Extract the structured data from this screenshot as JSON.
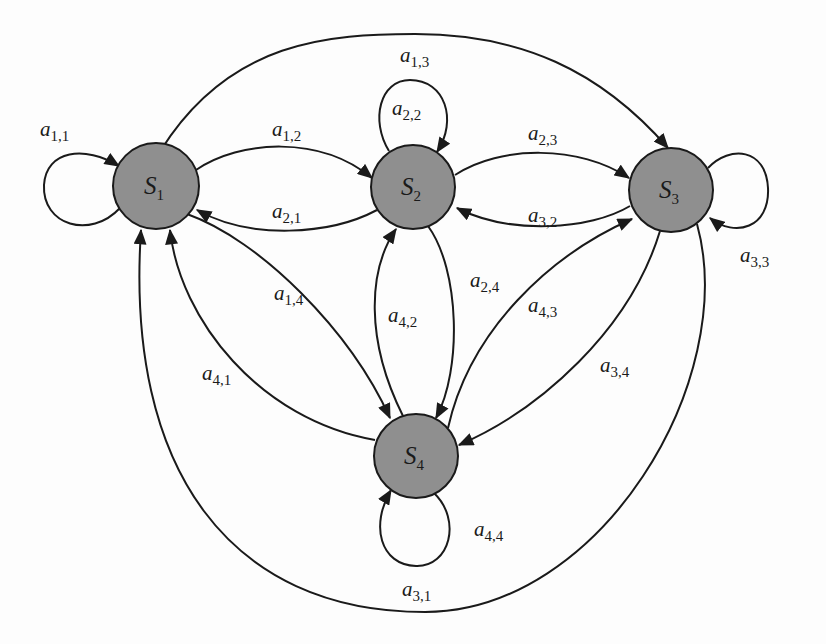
{
  "diagram": {
    "type": "markov-state-transition-graph",
    "colors": {
      "node_fill": "#8f8f8f",
      "stroke": "#1a1a1a",
      "background": "#fdfdfd"
    },
    "nodes": [
      {
        "id": "S1",
        "base": "S",
        "sub": "1",
        "cx": 156,
        "cy": 186,
        "r": 43
      },
      {
        "id": "S2",
        "base": "S",
        "sub": "2",
        "cx": 413,
        "cy": 187,
        "r": 42
      },
      {
        "id": "S3",
        "base": "S",
        "sub": "3",
        "cx": 671,
        "cy": 190,
        "r": 42
      },
      {
        "id": "S4",
        "base": "S",
        "sub": "4",
        "cx": 416,
        "cy": 456,
        "r": 42
      }
    ],
    "edges": [
      {
        "id": "a11",
        "from": "S1",
        "to": "S1",
        "label_base": "a",
        "label_sub": "1,1",
        "label_x": 40,
        "label_y": 136
      },
      {
        "id": "a12",
        "from": "S1",
        "to": "S2",
        "label_base": "a",
        "label_sub": "1,2",
        "label_x": 272,
        "label_y": 136
      },
      {
        "id": "a13",
        "from": "S1",
        "to": "S3",
        "label_base": "a",
        "label_sub": "1,3",
        "label_x": 400,
        "label_y": 62
      },
      {
        "id": "a21",
        "from": "S2",
        "to": "S1",
        "label_base": "a",
        "label_sub": "2,1",
        "label_x": 272,
        "label_y": 218
      },
      {
        "id": "a22",
        "from": "S2",
        "to": "S2",
        "label_base": "a",
        "label_sub": "2,2",
        "label_x": 392,
        "label_y": 115
      },
      {
        "id": "a23",
        "from": "S2",
        "to": "S3",
        "label_base": "a",
        "label_sub": "2,3",
        "label_x": 528,
        "label_y": 140
      },
      {
        "id": "a32",
        "from": "S3",
        "to": "S2",
        "label_base": "a",
        "label_sub": "3,2",
        "label_x": 528,
        "label_y": 222
      },
      {
        "id": "a33",
        "from": "S3",
        "to": "S3",
        "label_base": "a",
        "label_sub": "3,3",
        "label_x": 740,
        "label_y": 262
      },
      {
        "id": "a14",
        "from": "S1",
        "to": "S4",
        "label_base": "a",
        "label_sub": "1,4",
        "label_x": 274,
        "label_y": 300
      },
      {
        "id": "a41",
        "from": "S4",
        "to": "S1",
        "label_base": "a",
        "label_sub": "4,1",
        "label_x": 202,
        "label_y": 380
      },
      {
        "id": "a42",
        "from": "S4",
        "to": "S2",
        "label_base": "a",
        "label_sub": "4,2",
        "label_x": 388,
        "label_y": 322
      },
      {
        "id": "a24",
        "from": "S2",
        "to": "S4",
        "label_base": "a",
        "label_sub": "2,4",
        "label_x": 470,
        "label_y": 287
      },
      {
        "id": "a43",
        "from": "S4",
        "to": "S3",
        "label_base": "a",
        "label_sub": "4,3",
        "label_x": 528,
        "label_y": 312
      },
      {
        "id": "a34",
        "from": "S3",
        "to": "S4",
        "label_base": "a",
        "label_sub": "3,4",
        "label_x": 600,
        "label_y": 372
      },
      {
        "id": "a44",
        "from": "S4",
        "to": "S4",
        "label_base": "a",
        "label_sub": "4,4",
        "label_x": 474,
        "label_y": 536
      },
      {
        "id": "a31",
        "from": "S3",
        "to": "S1",
        "label_base": "a",
        "label_sub": "3,1",
        "label_x": 402,
        "label_y": 596
      }
    ]
  }
}
